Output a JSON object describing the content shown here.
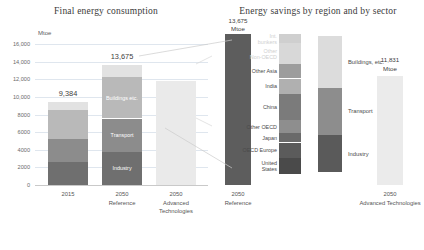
{
  "chart_data": [
    {
      "type": "bar",
      "title": "Final energy consumption",
      "ylabel": "Mtoe",
      "unit": "Mtoe",
      "xlabel": "",
      "ylim": [
        0,
        16000
      ],
      "grid": true,
      "legend_position": "in-bar",
      "ticks": [
        "16,000",
        "14,000",
        "12,000",
        "10,000",
        "8000",
        "6000",
        "4000",
        "2000",
        "0"
      ],
      "tick_values": [
        16000,
        14000,
        12000,
        10000,
        8000,
        6000,
        4000,
        2000,
        0
      ],
      "categories": [
        "2015",
        "2050 Reference",
        "2050 Advanced Technologies"
      ],
      "category_lines": [
        [
          "2015"
        ],
        [
          "2050",
          "Reference"
        ],
        [
          "2050",
          "Advanced",
          "Technologies"
        ]
      ],
      "totals": [
        9384,
        13675,
        11831
      ],
      "total_labels": [
        "9,384",
        "13,675",
        ""
      ],
      "series": [
        {
          "name": "Industry",
          "values": [
            2650,
            3800,
            0
          ],
          "color": "#6f6f6f"
        },
        {
          "name": "Transport",
          "values": [
            2600,
            3750,
            0
          ],
          "color": "#8c8c8c"
        },
        {
          "name": "Buildings etc.",
          "values": [
            3300,
            4700,
            0
          ],
          "color": "#b9b9b9"
        },
        {
          "name": "Other",
          "values": [
            834,
            1425,
            0
          ],
          "color": "#e2e2e2"
        }
      ],
      "bar3_color": "#eaeaea",
      "inbar_labels": [
        "Industry",
        "Transport",
        "Buildings etc.",
        "Other"
      ]
    },
    {
      "type": "bar",
      "title": "Energy savings by region and by sector",
      "unit": "Mtoe",
      "start_label": "13,675",
      "start_unit": "Mtoe",
      "start_value": 13675,
      "end_label": "11,831",
      "end_unit": "Mtoe",
      "end_value": 11831,
      "savings_total": 1844,
      "categories": [
        "2050 Reference",
        "2050 Advanced Technologies"
      ],
      "category_lines": [
        [
          "2050",
          "Reference"
        ],
        [
          "2050",
          "Advanced Technologies"
        ]
      ],
      "region_breakdown": {
        "name": "by region",
        "labels": [
          "Int. bunkers",
          "Other Non-OECD",
          "Other Asia",
          "India",
          "China",
          "Other OECD",
          "Japan",
          "OECD Europe",
          "United States"
        ],
        "values": [
          95,
          300,
          180,
          200,
          395,
          160,
          95,
          195,
          224
        ],
        "colors": [
          "#cfcfcf",
          "#d8d8d8",
          "#9d9d9d",
          "#b0b0b0",
          "#7b7b7b",
          "#8e8e8e",
          "#6a6a6a",
          "#5b5b5b",
          "#4a4a4a"
        ]
      },
      "sector_breakdown": {
        "name": "by sector",
        "labels": [
          "Buildings etc.",
          "Transport",
          "Industry"
        ],
        "values": [
          700,
          640,
          504
        ],
        "colors": [
          "#dcdcdc",
          "#8d8d8d",
          "#5a5a5a"
        ]
      },
      "reference_bar_color": "#5d5d5d",
      "advanced_bar_color": "#ebebeb"
    }
  ],
  "left": {
    "title": "Final energy consumption",
    "unit": "Mtoe",
    "ticks": [
      "16,000",
      "14,000",
      "12,000",
      "10,000",
      "8000",
      "6000",
      "4000",
      "2000",
      "0"
    ],
    "bars": [
      {
        "category": [
          "2015"
        ],
        "total": "9,384",
        "segments": [
          {
            "label": "",
            "show_label": false
          },
          {
            "label": "",
            "show_label": false
          },
          {
            "label": "",
            "show_label": false
          },
          {
            "label": "",
            "show_label": false
          }
        ]
      },
      {
        "category": [
          "2050",
          "Reference"
        ],
        "total": "13,675",
        "segments": [
          {
            "label": "Buildings etc.",
            "show_label": true
          },
          {
            "label": "Buildings etc.",
            "show_label": true
          },
          {
            "label": "Transport",
            "show_label": true
          },
          {
            "label": "Industry",
            "show_label": true
          }
        ]
      },
      {
        "category": [
          "2050",
          "Advanced",
          "Technologies"
        ],
        "total": "",
        "segments": []
      }
    ]
  },
  "right": {
    "title": "Energy savings by region and by sector",
    "start_value": "13,675",
    "start_unit": "Mtoe",
    "end_value": "11,831",
    "end_unit": "Mtoe",
    "regions": [
      "Int. bunkers",
      "Other Non-OECD",
      "Other Asia",
      "India",
      "China",
      "Other OECD",
      "Japan",
      "OECD Europe",
      "United States"
    ],
    "sectors": [
      "Buildings, etc.",
      "Transport",
      "Industry"
    ],
    "categories": [
      [
        "2050",
        "Reference"
      ],
      [
        "2050",
        "Advanced Technologies"
      ]
    ]
  }
}
